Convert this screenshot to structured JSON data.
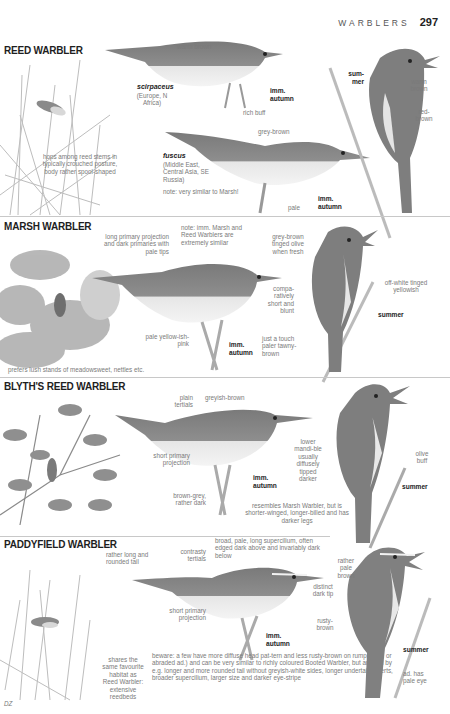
{
  "header": {
    "running_title": "WARBLERS",
    "page_number": "297"
  },
  "colors": {
    "plumage_dark": "#6b6b6b",
    "plumage_mid": "#8f8f8f",
    "underparts": "#ececec",
    "text_label": "#7a7a7a",
    "text_bold": "#222222",
    "divider": "#c8c8c8"
  },
  "sections": [
    {
      "title": "REED WARBLER",
      "labels": {
        "warm_brown_back": "warm brown",
        "scirpaceus": "scirpaceus",
        "scirpaceus_range": "(Europe, N Africa)",
        "imm_autumn_1": "imm. autumn",
        "rich_buff": "rich buff",
        "grey_brown": "grey-brown",
        "fuscus": "fuscus",
        "fuscus_range": "(Middle East, Central Asia, SE Russia)",
        "note": "note: very similar to Marsh!",
        "pale": "pale",
        "imm_autumn_2": "imm. autumn",
        "summer": "sum-mer",
        "warm_brown": "warm brown",
        "red_brown": "red-brown",
        "habitat": "hops among reed stems in typically crouched posture, body rather spool-shaped"
      }
    },
    {
      "title": "MARSH WARBLER",
      "labels": {
        "primary_projection": "long primary projection and dark primaries with pale tips",
        "note": "note: imm. Marsh and Reed Warblers are extremely similar",
        "grey_brown_olive": "grey-brown tinged olive when fresh",
        "bill": "compa-ratively short and blunt",
        "off_white": "off-white tinged yellowish",
        "summer": "summer",
        "legs": "pale yellow-ish-pink",
        "imm_autumn": "imm. autumn",
        "tawny": "just a touch paler tawny-brown",
        "habitat": "prefers lush stands of meadowsweet, nettles etc."
      }
    },
    {
      "title": "BLYTH'S REED WARBLER",
      "labels": {
        "plain_tertials": "plain tertials",
        "greyish_brown": "greyish-brown",
        "lower_mandible": "lower mandi-ble usually diffusely tipped darker",
        "olive_buff": "olive buff",
        "short_primary": "short primary projection",
        "imm_autumn": "imm. autumn",
        "summer": "summer",
        "legs": "brown-grey, rather dark",
        "resembles": "resembles Marsh Warbler, but is shorter-winged, longer-billed and has darker legs"
      }
    },
    {
      "title": "PADDYFIELD WARBLER",
      "labels": {
        "tail": "rather long and rounded tail",
        "contrasty_tertials": "contrasty tertials",
        "supercilium": "broad, pale, long supercilium, often edged dark above and invariably dark below",
        "pale_brown": "rather pale brown",
        "dark_tip": "distinct dark tip",
        "short_primary": "short primary projection",
        "imm_autumn": "imm. autumn",
        "rusty_brown": "rusty-brown",
        "summer": "summer",
        "pale_eye": "ad. has pale eye",
        "habitat": "shares the same favourite habitat as Reed Warbler: extensive reedbeds",
        "beware": "beware: a few have more diffuse head pat-tern and less rusty-brown on rump (imm. or abraded ad.) and can be very similar to richly coloured Booted Warbler, but are told by e.g. longer and more rounded tail without greyish-white sides, longer undertail-coverts, broader supercilium, larger size and darker eye-stripe"
      }
    }
  ],
  "footer": {
    "artist_initials": "DZ"
  }
}
